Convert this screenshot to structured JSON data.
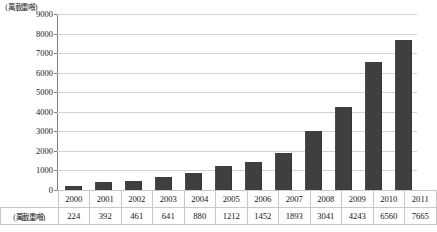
{
  "chart_data": {
    "type": "bar",
    "title": "",
    "xlabel": "",
    "ylabel": "(萬載重噸)",
    "unit_label": "(萬載重噸)",
    "categories": [
      "2000",
      "2001",
      "2002",
      "2003",
      "2004",
      "2005",
      "2006",
      "2007",
      "2008",
      "2009",
      "2010",
      "2011"
    ],
    "values": [
      224,
      392,
      461,
      641,
      880,
      1212,
      1452,
      1893,
      3041,
      4243,
      6560,
      7665
    ],
    "ylim": [
      0,
      9000
    ],
    "ytick_labels": [
      "0",
      "1000",
      "2000",
      "3000",
      "4000",
      "5000",
      "6000",
      "7000",
      "8000",
      "9000"
    ],
    "ytick_values": [
      0,
      1000,
      2000,
      3000,
      4000,
      5000,
      6000,
      7000,
      8000,
      9000
    ],
    "grid": true,
    "legend": "none",
    "bar_color": "#3f3f3f",
    "gridline_color": "#d2d2d2",
    "axis_color": "#7d7d7d"
  },
  "table": {
    "row_label": "(萬載重噸)",
    "header_row_label": "",
    "years": [
      "2000",
      "2001",
      "2002",
      "2003",
      "2004",
      "2005",
      "2006",
      "2007",
      "2008",
      "2009",
      "2010",
      "2011"
    ],
    "values": [
      "224",
      "392",
      "461",
      "641",
      "880",
      "1212",
      "1452",
      "1893",
      "3041",
      "4243",
      "6560",
      "7665"
    ]
  }
}
